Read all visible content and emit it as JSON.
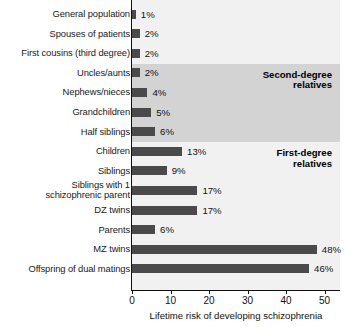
{
  "chart_data": {
    "type": "bar",
    "orientation": "horizontal",
    "title": "",
    "xlabel": "Lifetime risk of developing schizophrenia",
    "ylabel": "",
    "xlim": [
      0,
      54
    ],
    "xticks": [
      0,
      10,
      20,
      30,
      40,
      50
    ],
    "xtick_labels": [
      "0",
      "10",
      "20",
      "30",
      "40",
      "50"
    ],
    "grid": false,
    "legend": false,
    "value_suffix": "%",
    "bar_color": "#4a4a4a",
    "plot_background": "#f1f1f1",
    "band_color": "#d3d3d3",
    "categories": [
      "General population",
      "Spouses of patients",
      "First cousins (third degree)",
      "Uncles/aunts",
      "Nephews/nieces",
      "Grandchildren",
      "Half siblings",
      "Children",
      "Siblings",
      "Siblings with 1\nschizophrenic parent",
      "DZ twins",
      "Parents",
      "MZ twins",
      "Offspring of dual matings"
    ],
    "values": [
      1,
      2,
      2,
      2,
      4,
      5,
      6,
      13,
      9,
      17,
      17,
      6,
      48,
      46
    ],
    "value_labels": [
      "1%",
      "2%",
      "2%",
      "2%",
      "4%",
      "5%",
      "6%",
      "13%",
      "9%",
      "17%",
      "17%",
      "6%",
      "48%",
      "46%"
    ],
    "annotations": [
      {
        "text": "Second-degree\nrelatives",
        "group_start_index": 3,
        "group_end_index": 6
      },
      {
        "text": "First-degree\nrelatives",
        "group_start_index": 7,
        "group_end_index": 13
      }
    ]
  }
}
